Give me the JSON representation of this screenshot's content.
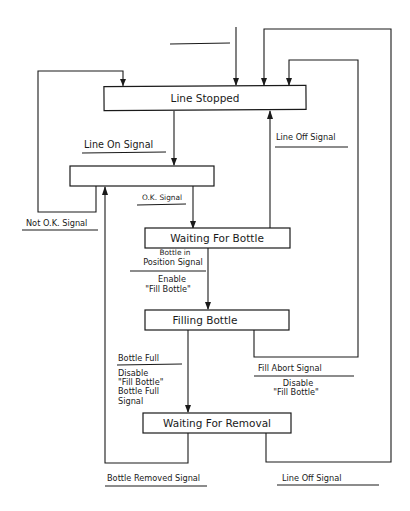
{
  "diagram": {
    "type": "state-transition-diagram",
    "states": [
      {
        "id": "line_stopped",
        "label": "Line Stopped"
      },
      {
        "id": "unnamed",
        "label": ""
      },
      {
        "id": "waiting_for_bottle",
        "label": "Waiting For Bottle"
      },
      {
        "id": "filling_bottle",
        "label": "Filling Bottle"
      },
      {
        "id": "waiting_for_removal",
        "label": "Waiting For Removal"
      }
    ],
    "transitions": {
      "line_on": {
        "event": "Line On Signal",
        "from": "line_stopped",
        "to": "unnamed"
      },
      "ok": {
        "event": "O.K. Signal",
        "from": "unnamed",
        "to": "waiting_for_bottle"
      },
      "not_ok": {
        "event": "Not O.K. Signal",
        "from": "unnamed",
        "to": "line_stopped"
      },
      "line_off_wait": {
        "event": "Line Off Signal",
        "from": "waiting_for_bottle",
        "to": "line_stopped"
      },
      "bottle_in_position": {
        "event_line1": "Bottle in",
        "event_line2": "Position Signal",
        "action_line1": "Enable",
        "action_line2": "\"Fill Bottle\"",
        "from": "waiting_for_bottle",
        "to": "filling_bottle"
      },
      "bottle_full": {
        "event": "Bottle Full",
        "action_line1": "Disable",
        "action_line2": "\"Fill Bottle\"",
        "action_line3": "Bottle Full",
        "action_line4": "Signal",
        "from": "filling_bottle",
        "to": "waiting_for_removal"
      },
      "fill_abort": {
        "event": "Fill Abort Signal",
        "action_line1": "Disable",
        "action_line2": "\"Fill Bottle\"",
        "from": "filling_bottle",
        "to": "line_stopped"
      },
      "bottle_removed": {
        "event": "Bottle Removed Signal",
        "from": "waiting_for_removal",
        "to": "unnamed"
      },
      "line_off_removal": {
        "event": "Line Off Signal",
        "from": "waiting_for_removal",
        "to": "line_stopped"
      }
    }
  }
}
